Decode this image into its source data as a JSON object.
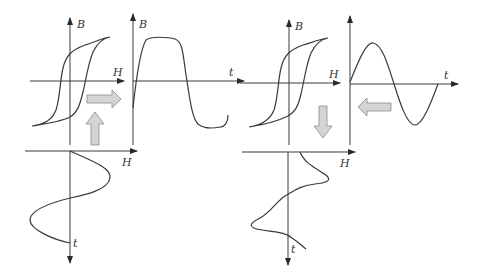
{
  "figure": {
    "left_panel": {
      "case": "square-ish B(t) derived from sinusoidal H(t)",
      "hysteresis": {
        "x_label": "H",
        "y_label": "B"
      },
      "b_waveform": {
        "x_label": "t",
        "y_label": "B"
      },
      "h_waveform": {
        "x_label": "H",
        "y_label": "t",
        "shape": "sinusoidal"
      },
      "arrows": [
        "up",
        "right"
      ]
    },
    "right_panel": {
      "case": "distorted H(t) derived from sinusoidal B(t)",
      "hysteresis": {
        "x_label": "H",
        "y_label": "B"
      },
      "b_waveform": {
        "x_label": "t",
        "y_label": "",
        "shape": "sinusoidal"
      },
      "h_waveform": {
        "x_label": "H",
        "y_label": "t",
        "shape": "peaked/distorted"
      },
      "arrows": [
        "left",
        "down"
      ]
    },
    "colors": {
      "line": "#3a3a3a",
      "arrow_fill": "#d4d4d4",
      "arrow_stroke": "#8a8a8a"
    }
  }
}
